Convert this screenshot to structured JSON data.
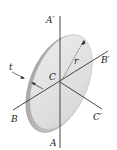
{
  "diagram": {
    "labels": {
      "a_top": "A′",
      "a_bottom": "A",
      "b_left": "B",
      "b_right": "B′",
      "c_center": "C",
      "c_right": "C′",
      "thickness": "t",
      "radius": "r"
    },
    "colors": {
      "disk_face": "#e4e4e4",
      "disk_edge": "#bdbdbd",
      "line": "#333333"
    }
  }
}
